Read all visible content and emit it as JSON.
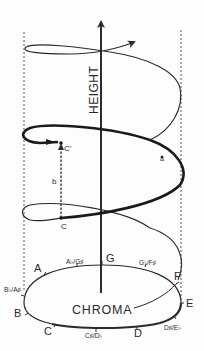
{
  "diagram": {
    "axis_label": "HEIGHT",
    "circle_label": "CHROMA",
    "points": {
      "lower": "C",
      "upper": "C'"
    },
    "segment_labels": {
      "helix_arc": "a",
      "vertical_distance": "b"
    },
    "notes": [
      {
        "label": "A",
        "pos": "A"
      },
      {
        "label": "A♭/G♯",
        "pos": "AbGs"
      },
      {
        "label": "G",
        "pos": "G"
      },
      {
        "label": "G♭/F♯",
        "pos": "GbFs"
      },
      {
        "label": "F",
        "pos": "F"
      },
      {
        "label": "E",
        "pos": "E"
      },
      {
        "label": "D♯/E♭",
        "pos": "DsEb"
      },
      {
        "label": "D",
        "pos": "D"
      },
      {
        "label": "C♯/D♭",
        "pos": "CsDb"
      },
      {
        "label": "C",
        "pos": "C"
      },
      {
        "label": "B",
        "pos": "B"
      },
      {
        "label": "B♭/A♯",
        "pos": "BbAs"
      }
    ],
    "colors": {
      "ink": "#2a2a2a",
      "background": "#fdfdfd"
    }
  }
}
